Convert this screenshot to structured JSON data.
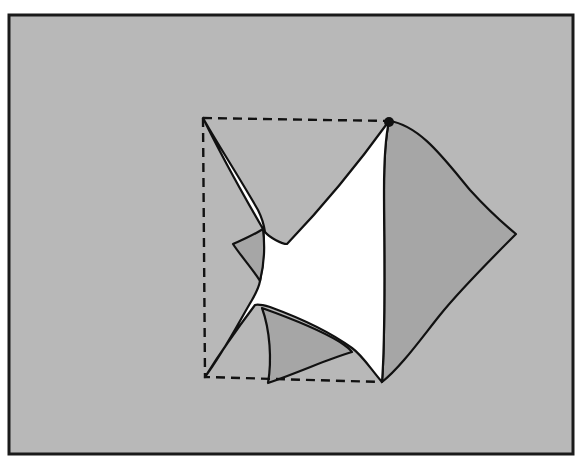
{
  "figure": {
    "text_labels": []
  },
  "colors": {
    "page": "#ffffff",
    "frame_border": "#1a1a1a",
    "background": "#b8b8b8",
    "white_region": "#ffffff",
    "flap_fill": "#a6a6a6",
    "outline": "#111111",
    "dashed_outline": "#111111"
  },
  "elements": {
    "dashed_square": {
      "style": "dashed",
      "role": "original sheet outline"
    },
    "white_region": {
      "role": "unfolded sheet area"
    },
    "flaps": [
      {
        "name": "right-flap",
        "shade": "medium-gray"
      },
      {
        "name": "bottom-flap",
        "shade": "medium-gray"
      },
      {
        "name": "left-flap",
        "shade": "medium-gray"
      }
    ],
    "corner_markers": [
      {
        "name": "top-right-corner-dot"
      }
    ]
  }
}
